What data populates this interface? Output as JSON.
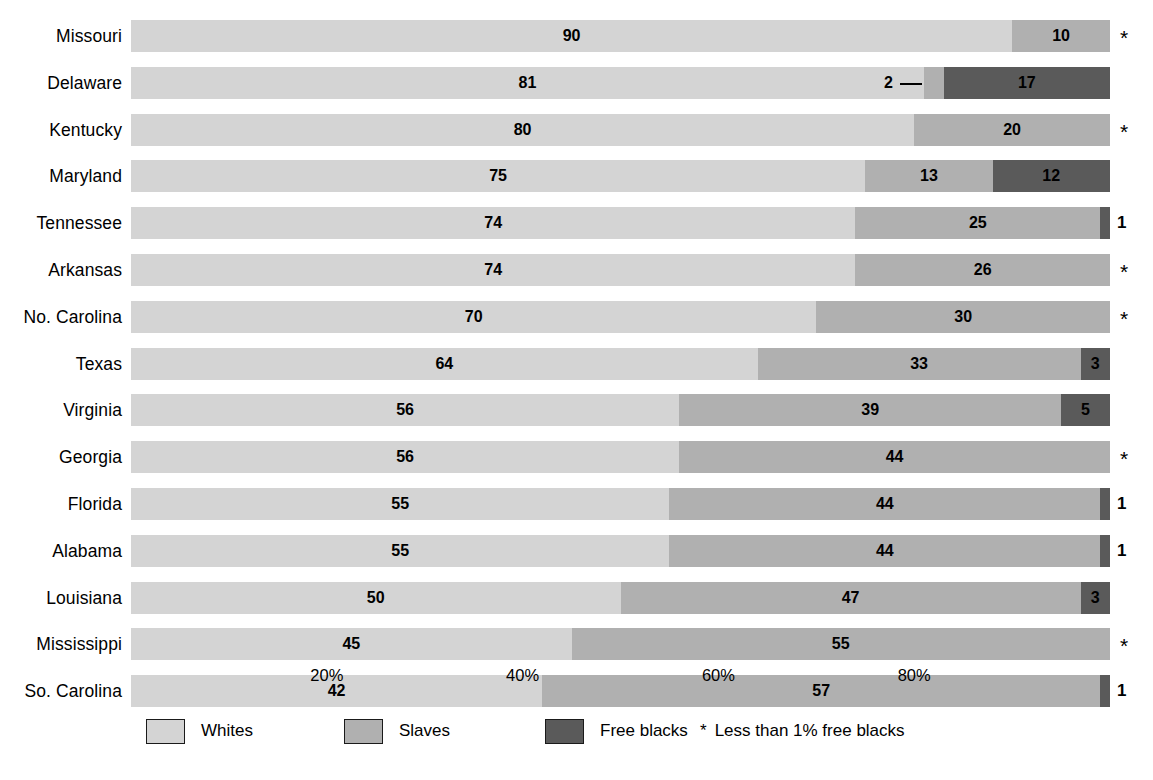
{
  "chart_data": {
    "type": "bar",
    "orientation": "horizontal",
    "stacked": true,
    "title": "",
    "subtitle": "",
    "xlabel": "",
    "ylabel": "",
    "xlim": [
      0,
      100
    ],
    "xticks": [
      20,
      40,
      60,
      80
    ],
    "xtick_labels": [
      "20%",
      "40%",
      "60%",
      "80%"
    ],
    "grid": false,
    "legend_position": "bottom",
    "categories": [
      "Missouri",
      "Delaware",
      "Kentucky",
      "Maryland",
      "Tennessee",
      "Arkansas",
      "No. Carolina",
      "Texas",
      "Virginia",
      "Georgia",
      "Florida",
      "Alabama",
      "Louisiana",
      "Mississippi",
      "So. Carolina"
    ],
    "series": [
      {
        "name": "Whites",
        "color": "#d4d4d4",
        "values": [
          90,
          81,
          80,
          75,
          74,
          74,
          70,
          64,
          56,
          56,
          55,
          55,
          50,
          45,
          42
        ]
      },
      {
        "name": "Slaves",
        "color": "#b0b0b0",
        "values": [
          10,
          2,
          20,
          13,
          25,
          26,
          30,
          33,
          39,
          44,
          44,
          44,
          47,
          55,
          57
        ]
      },
      {
        "name": "Free blacks",
        "color": "#5a5a5a",
        "values": [
          0,
          17,
          0,
          12,
          1,
          0,
          0,
          3,
          5,
          0,
          1,
          1,
          3,
          0,
          1
        ]
      }
    ],
    "annotations": [
      {
        "category": "Missouri",
        "marker": "*",
        "note": "Less than 1% free blacks"
      },
      {
        "category": "Kentucky",
        "marker": "*",
        "note": "Less than 1% free blacks"
      },
      {
        "category": "Arkansas",
        "marker": "*",
        "note": "Less than 1% free blacks"
      },
      {
        "category": "No. Carolina",
        "marker": "*",
        "note": "Less than 1% free blacks"
      },
      {
        "category": "Georgia",
        "marker": "*",
        "note": "Less than 1% free blacks"
      },
      {
        "category": "Mississippi",
        "marker": "*",
        "note": "Less than 1% free blacks"
      },
      {
        "category": "Delaware",
        "note": "Slaves value 2 shown with leader line"
      }
    ]
  },
  "rows": [
    {
      "label": "Missouri",
      "whites": 90,
      "slaves": 10,
      "free": 0,
      "whites_label": "90",
      "slaves_label": "10",
      "free_label": "",
      "right_marker": "*",
      "right_marker_type": "asterisk",
      "slaves_leader": false
    },
    {
      "label": "Delaware",
      "whites": 81,
      "slaves": 2,
      "free": 17,
      "whites_label": "81",
      "slaves_label": "2",
      "free_label": "17",
      "right_marker": "",
      "right_marker_type": "none",
      "slaves_leader": true
    },
    {
      "label": "Kentucky",
      "whites": 80,
      "slaves": 20,
      "free": 0,
      "whites_label": "80",
      "slaves_label": "20",
      "free_label": "",
      "right_marker": "*",
      "right_marker_type": "asterisk",
      "slaves_leader": false
    },
    {
      "label": "Maryland",
      "whites": 75,
      "slaves": 13,
      "free": 12,
      "whites_label": "75",
      "slaves_label": "13",
      "free_label": "12",
      "right_marker": "",
      "right_marker_type": "none",
      "slaves_leader": false
    },
    {
      "label": "Tennessee",
      "whites": 74,
      "slaves": 25,
      "free": 1,
      "whites_label": "74",
      "slaves_label": "25",
      "free_label": "",
      "right_marker": "1",
      "right_marker_type": "number",
      "slaves_leader": false
    },
    {
      "label": "Arkansas",
      "whites": 74,
      "slaves": 26,
      "free": 0,
      "whites_label": "74",
      "slaves_label": "26",
      "free_label": "",
      "right_marker": "*",
      "right_marker_type": "asterisk",
      "slaves_leader": false
    },
    {
      "label": "No. Carolina",
      "whites": 70,
      "slaves": 30,
      "free": 0,
      "whites_label": "70",
      "slaves_label": "30",
      "free_label": "",
      "right_marker": "*",
      "right_marker_type": "asterisk",
      "slaves_leader": false
    },
    {
      "label": "Texas",
      "whites": 64,
      "slaves": 33,
      "free": 3,
      "whites_label": "64",
      "slaves_label": "33",
      "free_label": "3",
      "right_marker": "",
      "right_marker_type": "none",
      "slaves_leader": false
    },
    {
      "label": "Virginia",
      "whites": 56,
      "slaves": 39,
      "free": 5,
      "whites_label": "56",
      "slaves_label": "39",
      "free_label": "5",
      "right_marker": "",
      "right_marker_type": "none",
      "slaves_leader": false
    },
    {
      "label": "Georgia",
      "whites": 56,
      "slaves": 44,
      "free": 0,
      "whites_label": "56",
      "slaves_label": "44",
      "free_label": "",
      "right_marker": "*",
      "right_marker_type": "asterisk",
      "slaves_leader": false
    },
    {
      "label": "Florida",
      "whites": 55,
      "slaves": 44,
      "free": 1,
      "whites_label": "55",
      "slaves_label": "44",
      "free_label": "",
      "right_marker": "1",
      "right_marker_type": "number",
      "slaves_leader": false
    },
    {
      "label": "Alabama",
      "whites": 55,
      "slaves": 44,
      "free": 1,
      "whites_label": "55",
      "slaves_label": "44",
      "free_label": "",
      "right_marker": "1",
      "right_marker_type": "number",
      "slaves_leader": false
    },
    {
      "label": "Louisiana",
      "whites": 50,
      "slaves": 47,
      "free": 3,
      "whites_label": "50",
      "slaves_label": "47",
      "free_label": "3",
      "right_marker": "",
      "right_marker_type": "none",
      "slaves_leader": false
    },
    {
      "label": "Mississippi",
      "whites": 45,
      "slaves": 55,
      "free": 0,
      "whites_label": "45",
      "slaves_label": "55",
      "free_label": "",
      "right_marker": "*",
      "right_marker_type": "asterisk",
      "slaves_leader": false
    },
    {
      "label": "So. Carolina",
      "whites": 42,
      "slaves": 57,
      "free": 1,
      "whites_label": "42",
      "slaves_label": "57",
      "free_label": "",
      "right_marker": "1",
      "right_marker_type": "number",
      "slaves_leader": false
    }
  ],
  "axis": {
    "ticks": [
      {
        "value": 20,
        "label": "20%"
      },
      {
        "value": 40,
        "label": "40%"
      },
      {
        "value": 60,
        "label": "60%"
      },
      {
        "value": 80,
        "label": "80%"
      }
    ]
  },
  "legend": {
    "items": [
      {
        "label": "Whites",
        "color": "#d4d4d4",
        "x": 146
      },
      {
        "label": "Slaves",
        "color": "#b0b0b0",
        "x": 344
      },
      {
        "label": "Free blacks",
        "color": "#5a5a5a",
        "x": 545
      }
    ],
    "note_star": "*",
    "note_text": "Less than 1% free blacks"
  },
  "colors": {
    "whites": "#d4d4d4",
    "slaves": "#b0b0b0",
    "free_blacks": "#5a5a5a",
    "text": "#000000",
    "background": "#ffffff"
  }
}
